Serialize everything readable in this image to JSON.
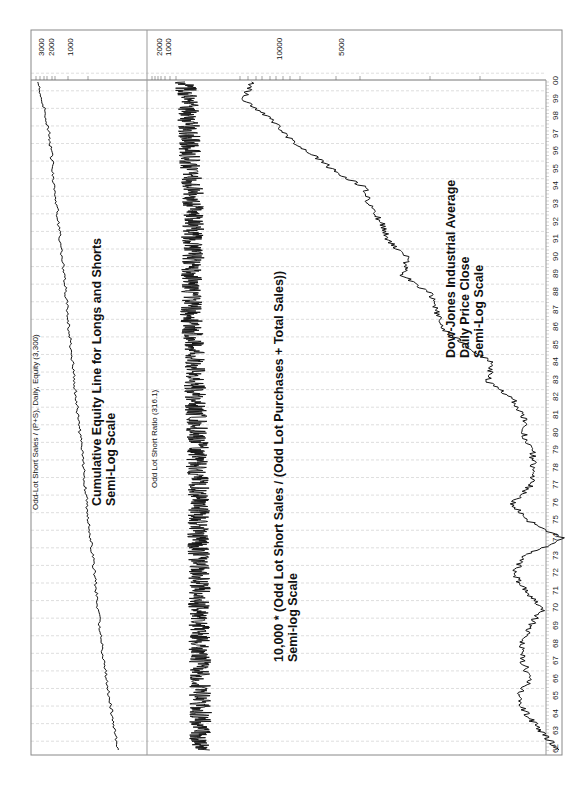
{
  "chart_data": [
    {
      "type": "line",
      "orientation": "rotated -90deg (time axis runs bottom-to-top along right edge)",
      "title": "Odd-Lot Short Sales / (P+S), Daily, Equity (3,300)",
      "annotation": [
        "Cumulative Equity Line for Longs and Shorts",
        "Semi-Log Scale"
      ],
      "scale": "log",
      "tick_labels": [
        "3000",
        "2000",
        "1000"
      ],
      "x": [
        "62",
        "63",
        "64",
        "65",
        "66",
        "67",
        "68",
        "69",
        "70",
        "71",
        "72",
        "73",
        "74",
        "75",
        "76",
        "77",
        "78",
        "79",
        "80",
        "81",
        "82",
        "83",
        "84",
        "85",
        "86",
        "87",
        "88",
        "89",
        "90",
        "91",
        "92",
        "93",
        "94",
        "95",
        "96",
        "97",
        "98",
        "99",
        "00"
      ],
      "series": [
        {
          "name": "Equity",
          "values": [
            100,
            115,
            130,
            150,
            165,
            185,
            205,
            225,
            240,
            260,
            280,
            300,
            330,
            360,
            390,
            420,
            450,
            490,
            530,
            580,
            620,
            680,
            720,
            780,
            850,
            920,
            980,
            1050,
            1150,
            1250,
            1350,
            1450,
            1600,
            1700,
            1850,
            2000,
            2300,
            2700,
            3300
          ]
        }
      ],
      "final_value": 3300
    },
    {
      "type": "line",
      "title": "Odd Lot Short Ratio (316.1)",
      "annotation": [
        "10,000 * (Odd Lot Short Sales / (Odd Lot Purchases + Total Sales))",
        "Semi-log Scale"
      ],
      "scale": "log",
      "tick_labels": [
        "2000",
        "1000"
      ],
      "x": [
        "62",
        "63",
        "64",
        "65",
        "66",
        "67",
        "68",
        "69",
        "70",
        "71",
        "72",
        "73",
        "74",
        "75",
        "76",
        "77",
        "78",
        "79",
        "80",
        "81",
        "82",
        "83",
        "84",
        "85",
        "86",
        "87",
        "88",
        "89",
        "90",
        "91",
        "92",
        "93",
        "94",
        "95",
        "96",
        "97",
        "98",
        "99",
        "00"
      ],
      "series": [
        {
          "name": "Odd Lot Short Ratio",
          "values": [
            40,
            45,
            42,
            45,
            50,
            45,
            48,
            50,
            55,
            48,
            50,
            52,
            60,
            55,
            50,
            55,
            70,
            60,
            65,
            75,
            80,
            90,
            100,
            110,
            130,
            150,
            120,
            140,
            110,
            130,
            100,
            110,
            120,
            150,
            170,
            180,
            200,
            230,
            316.1
          ]
        }
      ],
      "final_value": 316.1
    },
    {
      "type": "line",
      "title": "Dow-Jones Industrial Average",
      "annotation": [
        "Dow-Jones Industrial Average",
        "Daily Price Close",
        "Semi-Log Scale"
      ],
      "scale": "log",
      "tick_labels": [
        "10000",
        "5000"
      ],
      "x": [
        "62",
        "63",
        "64",
        "65",
        "66",
        "67",
        "68",
        "69",
        "70",
        "71",
        "72",
        "73",
        "74",
        "75",
        "76",
        "77",
        "78",
        "79",
        "80",
        "81",
        "82",
        "83",
        "84",
        "85",
        "86",
        "87",
        "88",
        "89",
        "90",
        "91",
        "92",
        "93",
        "94",
        "95",
        "96",
        "97",
        "98",
        "99",
        "00"
      ],
      "series": [
        {
          "name": "DJIA Close",
          "values": [
            650,
            760,
            870,
            950,
            850,
            900,
            920,
            850,
            760,
            880,
            980,
            900,
            620,
            850,
            1000,
            850,
            820,
            830,
            900,
            900,
            1000,
            1250,
            1200,
            1500,
            1900,
            2000,
            2100,
            2700,
            2600,
            3100,
            3300,
            3700,
            3800,
            5100,
            6400,
            7900,
            9200,
            11500,
            10800
          ]
        }
      ]
    }
  ],
  "labels": {
    "panel1_title": "Odd-Lot Short Sales / (P+S), Daily, Equity (3,300)",
    "panel1_note1": "Cumulative Equity Line for Longs and Shorts",
    "panel1_note2": "Semi-Log Scale",
    "panel1_ticks": [
      "3000",
      "2000",
      "1000"
    ],
    "panel2_title": "Odd Lot Short Ratio (316.1)",
    "panel2_note1": "10,000 * (Odd Lot Short Sales / (Odd Lot Purchases + Total Sales))",
    "panel2_note2": "Semi-log Scale",
    "panel2_ticks": [
      "2000",
      "1000"
    ],
    "panel3_note1": "Dow-Jones Industrial Average",
    "panel3_note2": "Daily Price Close",
    "panel3_note3": "Semi-Log Scale",
    "panel3_ticks": [
      "10000",
      "5000"
    ],
    "years": [
      "62",
      "63",
      "64",
      "65",
      "66",
      "67",
      "68",
      "69",
      "70",
      "71",
      "72",
      "73",
      "74",
      "75",
      "76",
      "77",
      "78",
      "79",
      "80",
      "81",
      "82",
      "83",
      "84",
      "85",
      "86",
      "87",
      "88",
      "89",
      "90",
      "91",
      "92",
      "93",
      "94",
      "95",
      "96",
      "97",
      "98",
      "99",
      "00"
    ]
  },
  "colors": {
    "line": "#111111",
    "grid": "#c8c8c8",
    "frame": "#888888"
  }
}
